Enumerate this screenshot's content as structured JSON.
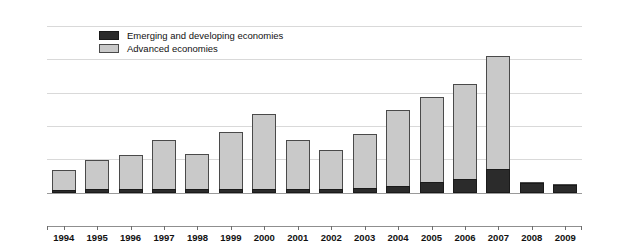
{
  "chart_data": {
    "type": "bar",
    "title": "",
    "subtitle": "",
    "xlabel": "",
    "ylabel": "",
    "stacked": true,
    "grid": true,
    "legend_position": "top-left",
    "ylim": [
      -5,
      25
    ],
    "yticks": [
      25,
      20,
      15,
      10,
      5,
      0,
      -5
    ],
    "ytick_labels": [
      "25",
      "20",
      "15",
      "10",
      "5",
      "0",
      "-5"
    ],
    "dual_axis": true,
    "categories": [
      "1994",
      "1995",
      "1996",
      "1997",
      "1998",
      "1999",
      "2000",
      "2001",
      "2002",
      "2003",
      "2004",
      "2005",
      "2006",
      "2007",
      "2008",
      "2009"
    ],
    "series": [
      {
        "name": "Emerging and developing economies",
        "color": "#2b2b2b",
        "values": [
          0.4,
          0.5,
          0.5,
          0.6,
          0.5,
          0.5,
          0.6,
          0.5,
          0.5,
          0.7,
          1.0,
          1.6,
          2.1,
          3.5,
          1.5,
          1.2
        ]
      },
      {
        "name": "Advanced economies",
        "color": "#c9c9c9",
        "values": [
          3.1,
          4.5,
          5.3,
          7.5,
          5.5,
          8.7,
          11.4,
          7.5,
          6.0,
          8.3,
          11.5,
          12.9,
          14.4,
          17.1,
          0.1,
          0.1
        ]
      }
    ],
    "totals": [
      3.5,
      5.0,
      5.8,
      8.1,
      6.0,
      9.2,
      12.0,
      8.0,
      6.5,
      9.0,
      12.5,
      14.5,
      16.5,
      20.6,
      1.6,
      1.3
    ]
  },
  "legend": {
    "items": [
      {
        "label": "Emerging and developing economies",
        "swatch": "emerging"
      },
      {
        "label": "Advanced economies",
        "swatch": "advanced"
      }
    ]
  },
  "colors": {
    "emerging": "#2b2b2b",
    "advanced": "#c9c9c9",
    "grid": "#d9d9d9",
    "axis": "#8f8f8f",
    "text": "#111111",
    "background": "#ffffff"
  }
}
